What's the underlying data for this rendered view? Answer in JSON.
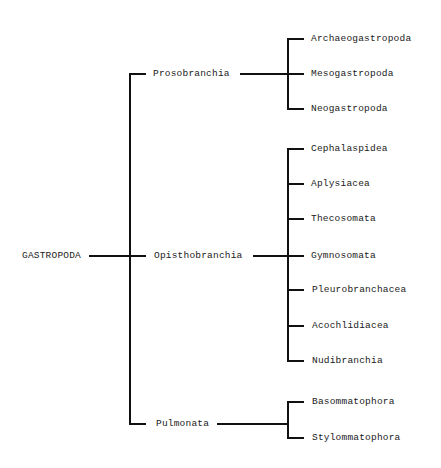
{
  "diagram": {
    "type": "taxonomy-tree",
    "root": {
      "label": "GASTROPODA",
      "children": [
        {
          "label": "Prosobranchia",
          "children": [
            {
              "label": "Archaeogastropoda"
            },
            {
              "label": "Mesogastropoda"
            },
            {
              "label": "Neogastropoda"
            }
          ]
        },
        {
          "label": "Opisthobranchia",
          "children": [
            {
              "label": "Cephalaspidea"
            },
            {
              "label": "Aplysiacea"
            },
            {
              "label": "Thecosomata"
            },
            {
              "label": "Gymnosomata"
            },
            {
              "label": "Pleurobranchacea"
            },
            {
              "label": "Acochlidiacea"
            },
            {
              "label": "Nudibranchia"
            }
          ]
        },
        {
          "label": "Pulmonata",
          "children": [
            {
              "label": "Basommatophora"
            },
            {
              "label": "Stylommatophora"
            }
          ]
        }
      ]
    }
  },
  "colors": {
    "line": "#111111",
    "text": "#1a1a1a",
    "background": "#ffffff"
  }
}
